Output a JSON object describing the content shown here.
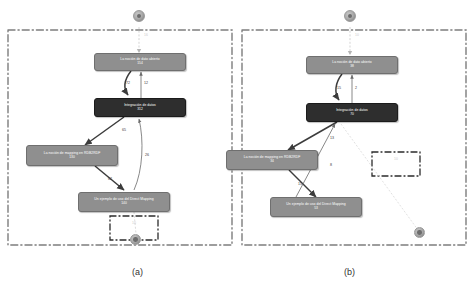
{
  "figure": {
    "background": "#ffffff",
    "node_grey_color": "#8f8f8f",
    "node_dark_color": "#2e2e2e",
    "border_color": "#7d7d7d",
    "edge_color": "#4a4a4a"
  },
  "panels": [
    {
      "id": "a",
      "caption": "(a)",
      "top_circle": {
        "name": "source-node",
        "label": ""
      },
      "bottom_circle": {
        "name": "sink-node",
        "label": ""
      },
      "entry_edge_label": "16",
      "inner_box_label": "10",
      "nodes": [
        {
          "id": "dato-abierto",
          "label": "La noción de dato abierto",
          "value": "154",
          "style": "grey"
        },
        {
          "id": "integracion",
          "label": "Integración de datos",
          "value": "312",
          "style": "dark"
        },
        {
          "id": "mapping-rdb2rdf",
          "label": "La noción de mapping en RDB2RDF",
          "value": "130",
          "style": "grey"
        },
        {
          "id": "direct-mapping",
          "label": "Un ejemplo de uso del Direct Mapping",
          "value": "140",
          "style": "grey"
        }
      ],
      "edges": [
        {
          "from": "dato-abierto",
          "to": "integracion",
          "label": "72"
        },
        {
          "from": "integracion",
          "to": "dato-abierto",
          "label": "12"
        },
        {
          "from": "integracion",
          "to": "mapping-rdb2rdf",
          "label": "65"
        },
        {
          "from": "direct-mapping",
          "to": "integracion",
          "label": "26"
        },
        {
          "from": "mapping-rdb2rdf",
          "to": "direct-mapping",
          "label": "62"
        }
      ]
    },
    {
      "id": "b",
      "caption": "(b)",
      "top_circle": {
        "name": "source-node",
        "label": ""
      },
      "bottom_circle": {
        "name": "sink-node",
        "label": ""
      },
      "entry_edge_label": "10",
      "inner_box_label": "10",
      "nodes": [
        {
          "id": "dato-abierto",
          "label": "La noción de dato abierto",
          "value": "38",
          "style": "grey"
        },
        {
          "id": "integracion",
          "label": "Integración de datos",
          "value": "70",
          "style": "dark"
        },
        {
          "id": "mapping-rdb2rdf",
          "label": "La noción de mapping en RDB2RDF",
          "value": "34",
          "style": "grey"
        },
        {
          "id": "direct-mapping",
          "label": "Un ejemplo de uso del Direct Mapping",
          "value": "53",
          "style": "grey"
        }
      ],
      "edges": [
        {
          "from": "dato-abierto",
          "to": "integracion",
          "label": "15"
        },
        {
          "from": "integracion",
          "to": "dato-abierto",
          "label": "2"
        },
        {
          "from": "integracion",
          "to": "mapping-rdb2rdf",
          "label": "13"
        },
        {
          "from": "direct-mapping",
          "to": "integracion",
          "label": "8"
        },
        {
          "from": "mapping-rdb2rdf",
          "to": "direct-mapping",
          "label": "15"
        }
      ]
    }
  ]
}
